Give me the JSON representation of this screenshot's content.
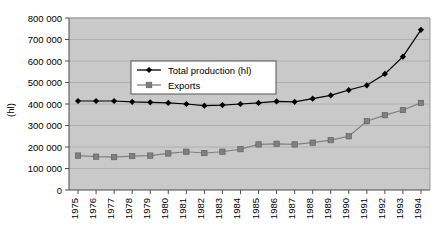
{
  "chart_data": {
    "type": "line",
    "title": "",
    "xlabel": "",
    "ylabel": "(hl)",
    "ylim": [
      0,
      800000
    ],
    "ytick_values": [
      0,
      100000,
      200000,
      300000,
      400000,
      500000,
      600000,
      700000,
      800000
    ],
    "ytick_labels": [
      "0",
      "100 000",
      "200 000",
      "300 000",
      "400 000",
      "500 000",
      "600 000",
      "700 000",
      "800 000"
    ],
    "grid": true,
    "legend_position": "upper-left-inside",
    "categories": [
      "1975",
      "1976",
      "1977",
      "1978",
      "1979",
      "1980",
      "1981",
      "1982",
      "1983",
      "1984",
      "1985",
      "1986",
      "1987",
      "1988",
      "1989",
      "1990",
      "1991",
      "1992",
      "1993",
      "1994"
    ],
    "series": [
      {
        "name": "Total production (hl)",
        "marker": "diamond",
        "color": "#000000",
        "values": [
          414000,
          414000,
          414000,
          410000,
          408000,
          405000,
          400000,
          392000,
          395000,
          400000,
          405000,
          412000,
          410000,
          425000,
          440000,
          465000,
          487000,
          540000,
          620000,
          745000
        ]
      },
      {
        "name": "Exports",
        "marker": "square",
        "color": "#808080",
        "values": [
          160000,
          155000,
          153000,
          158000,
          160000,
          170000,
          178000,
          172000,
          178000,
          190000,
          212000,
          215000,
          212000,
          220000,
          232000,
          250000,
          320000,
          348000,
          372000,
          405000
        ]
      }
    ]
  },
  "legend": {
    "entries": [
      {
        "label": "Total production (hl)"
      },
      {
        "label": "Exports"
      }
    ]
  },
  "colors": {
    "plot_background": "#c9c9c9",
    "gridline": "#b0b0b0",
    "axis": "#4d4d4d",
    "production": "#000000",
    "exports": "#808080",
    "legend_background": "#ffffff",
    "legend_border": "#555555"
  }
}
